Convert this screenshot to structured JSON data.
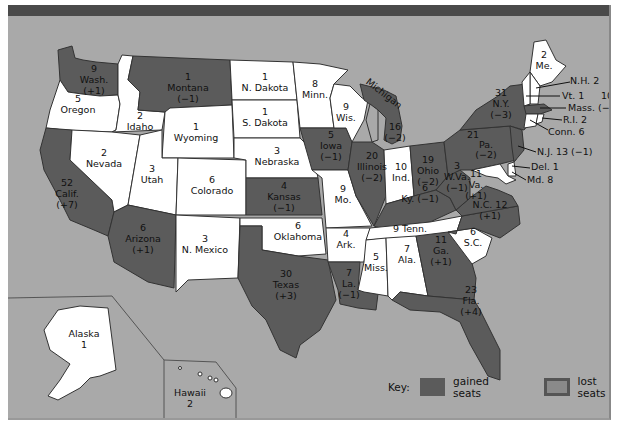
{
  "map": {
    "colors": {
      "background": "#a9a9a9",
      "changed_state": "#5b5b5b",
      "unchanged_state": "#ffffff",
      "top_bar": "#4a4a4a"
    },
    "states": [
      {
        "name": "Wash.",
        "seats": "9",
        "change": "(+1)"
      },
      {
        "name": "Oregon",
        "seats": "5",
        "change": ""
      },
      {
        "name": "Calif.",
        "seats": "52",
        "change": "(+7)"
      },
      {
        "name": "Idaho",
        "seats": "2",
        "change": ""
      },
      {
        "name": "Nevada",
        "seats": "2",
        "change": ""
      },
      {
        "name": "Montana",
        "seats": "1",
        "change": "(−1)"
      },
      {
        "name": "Wyoming",
        "seats": "1",
        "change": ""
      },
      {
        "name": "Utah",
        "seats": "3",
        "change": ""
      },
      {
        "name": "Arizona",
        "seats": "6",
        "change": "(+1)"
      },
      {
        "name": "Colorado",
        "seats": "6",
        "change": ""
      },
      {
        "name": "N. Mexico",
        "seats": "3",
        "change": ""
      },
      {
        "name": "N. Dakota",
        "seats": "1",
        "change": ""
      },
      {
        "name": "S. Dakota",
        "seats": "1",
        "change": ""
      },
      {
        "name": "Nebraska",
        "seats": "3",
        "change": ""
      },
      {
        "name": "Kansas",
        "seats": "4",
        "change": "(−1)"
      },
      {
        "name": "Oklahoma",
        "seats": "6",
        "change": ""
      },
      {
        "name": "Texas",
        "seats": "30",
        "change": "(+3)"
      },
      {
        "name": "Minn.",
        "seats": "8",
        "change": ""
      },
      {
        "name": "Iowa",
        "seats": "5",
        "change": "(−1)"
      },
      {
        "name": "Mo.",
        "seats": "9",
        "change": ""
      },
      {
        "name": "Ark.",
        "seats": "4",
        "change": ""
      },
      {
        "name": "La.",
        "seats": "7",
        "change": "(−1)"
      },
      {
        "name": "Wis.",
        "seats": "9",
        "change": ""
      },
      {
        "name": "Illinois",
        "seats": "20",
        "change": "(−2)"
      },
      {
        "name": "Michigan",
        "seats": "16",
        "change": "(−2)"
      },
      {
        "name": "Ind.",
        "seats": "10",
        "change": ""
      },
      {
        "name": "Ohio",
        "seats": "19",
        "change": "(−2)"
      },
      {
        "name": "Ky.",
        "seats": "6",
        "change": "(−1)"
      },
      {
        "name": "Tenn.",
        "seats": "9",
        "change": ""
      },
      {
        "name": "Miss.",
        "seats": "5",
        "change": ""
      },
      {
        "name": "Ala.",
        "seats": "7",
        "change": ""
      },
      {
        "name": "Ga.",
        "seats": "11",
        "change": "(+1)"
      },
      {
        "name": "Fla.",
        "seats": "23",
        "change": "(+4)"
      },
      {
        "name": "S.C.",
        "seats": "6",
        "change": ""
      },
      {
        "name": "N.C.",
        "seats": "12",
        "change": "(+1)"
      },
      {
        "name": "Va.",
        "seats": "11",
        "change": "(+1)"
      },
      {
        "name": "W.Va.",
        "seats": "3",
        "change": "(−1)"
      },
      {
        "name": "Pa.",
        "seats": "21",
        "change": "(−2)"
      },
      {
        "name": "N.Y.",
        "seats": "31",
        "change": "(−3)"
      },
      {
        "name": "Me.",
        "seats": "2",
        "change": ""
      },
      {
        "name": "N.H.",
        "seats": "2",
        "change": ""
      },
      {
        "name": "Vt.",
        "seats": "1",
        "change": ""
      },
      {
        "name": "Mass.",
        "seats": "10",
        "change": "(−1)"
      },
      {
        "name": "R.I.",
        "seats": "2",
        "change": ""
      },
      {
        "name": "Conn.",
        "seats": "6",
        "change": ""
      },
      {
        "name": "N.J.",
        "seats": "13",
        "change": "(−1)"
      },
      {
        "name": "Del.",
        "seats": "1",
        "change": ""
      },
      {
        "name": "Md.",
        "seats": "8",
        "change": ""
      },
      {
        "name": "Alaska",
        "seats": "1",
        "change": ""
      },
      {
        "name": "Hawaii",
        "seats": "2",
        "change": ""
      }
    ],
    "labels": {
      "wa": {
        "n": "9",
        "name": "Wash.",
        "c": "(+1)"
      },
      "or": {
        "n": "5",
        "name": "Oregon"
      },
      "ca": {
        "n": "52",
        "name": "Calif.",
        "c": "(+7)"
      },
      "id": {
        "n": "2",
        "name": "Idaho"
      },
      "nv": {
        "n": "2",
        "name": "Nevada"
      },
      "mt": {
        "n": "1",
        "name": "Montana",
        "c": "(−1)"
      },
      "wy": {
        "n": "1",
        "name": "Wyoming"
      },
      "ut": {
        "n": "3",
        "name": "Utah"
      },
      "az": {
        "n": "6",
        "name": "Arizona",
        "c": "(+1)"
      },
      "co": {
        "n": "6",
        "name": "Colorado"
      },
      "nm": {
        "n": "3",
        "name": "N. Mexico"
      },
      "nd": {
        "n": "1",
        "name": "N. Dakota"
      },
      "sd": {
        "n": "1",
        "name": "S. Dakota"
      },
      "ne": {
        "n": "3",
        "name": "Nebraska"
      },
      "ks": {
        "n": "4",
        "name": "Kansas",
        "c": "(−1)"
      },
      "ok": {
        "n": "6",
        "name": "Oklahoma"
      },
      "tx": {
        "n": "30",
        "name": "Texas",
        "c": "(+3)"
      },
      "mn": {
        "n": "8",
        "name": "Minn."
      },
      "ia": {
        "n": "5",
        "name": "Iowa",
        "c": "(−1)"
      },
      "mo": {
        "n": "9",
        "name": "Mo."
      },
      "ar": {
        "n": "4",
        "name": "Ark."
      },
      "la": {
        "n": "7",
        "name": "La.",
        "c": "(−1)"
      },
      "wi": {
        "n": "9",
        "name": "Wis."
      },
      "il": {
        "n": "20",
        "name": "Illinois",
        "c": "(−2)"
      },
      "mi": {
        "n": "16",
        "name": "Michigan",
        "c": "(−2)"
      },
      "in": {
        "n": "10",
        "name": "Ind."
      },
      "oh": {
        "n": "19",
        "name": "Ohio",
        "c": "(−2)"
      },
      "ky": {
        "line": "Ky. (−1)",
        "n": "6"
      },
      "tn": {
        "line": "9 Tenn."
      },
      "ms": {
        "n": "5",
        "name": "Miss."
      },
      "al": {
        "n": "7",
        "name": "Ala."
      },
      "ga": {
        "n": "11",
        "name": "Ga.",
        "c": "(+1)"
      },
      "fl": {
        "n": "23",
        "name": "Fla.",
        "c": "(+4)"
      },
      "sc": {
        "n": "6",
        "name": "S.C."
      },
      "nc": {
        "line": "N.C. 12",
        "c": "(+1)"
      },
      "va": {
        "n": "11",
        "name": "Va.",
        "c": "(+1)"
      },
      "wv": {
        "n": "3",
        "name": "W.Va.",
        "c": "(−1)"
      },
      "pa": {
        "n": "21",
        "name": "Pa.",
        "c": "(−2)"
      },
      "ny": {
        "n": "31",
        "name": "N.Y.",
        "c": "(−3)"
      },
      "me": {
        "n": "2",
        "name": "Me."
      },
      "nh": {
        "line": "N.H. 2"
      },
      "vt": {
        "line": "Vt. 1"
      },
      "ma": {
        "n": "10",
        "line": "Mass. (−1)"
      },
      "ri": {
        "line": "R.I. 2"
      },
      "ct": {
        "line": "Conn. 6"
      },
      "nj": {
        "line": "N.J. 13  (−1)"
      },
      "de": {
        "line": "Del. 1"
      },
      "md": {
        "line": "Md. 8"
      },
      "ak": {
        "name": "Alaska",
        "n": "1"
      },
      "hi": {
        "name": "Hawaii",
        "n": "2"
      }
    }
  },
  "legend": {
    "key_label": "Key:",
    "gained_label": "gained seats",
    "lost_label": "lost seats",
    "gained_color": "#5b5b5b",
    "lost_color": "#8a8a8a"
  }
}
